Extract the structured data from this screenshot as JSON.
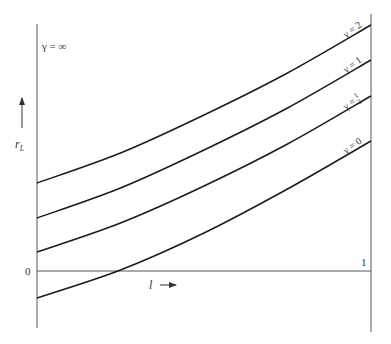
{
  "chart_data": {
    "type": "line",
    "title": "",
    "xlabel": "l",
    "ylabel": "r_L",
    "x_ticks": [
      "0",
      "1"
    ],
    "y_ticks": [
      "0"
    ],
    "xlim": [
      0,
      1
    ],
    "ylim": [
      -0.57,
      2.57
    ],
    "grid": false,
    "legend_position": "inline, at right end of each curve",
    "annotations": [
      "γ = ∞ (near top-left, along the left axis)"
    ],
    "x": [
      0,
      0.25,
      0.5,
      0.75,
      1.0
    ],
    "series": [
      {
        "name": "γ = 2",
        "label": "γ = 2",
        "values": [
          0.88,
          1.18,
          1.56,
          1.98,
          2.46
        ]
      },
      {
        "name": "γ = 1",
        "label": "γ = 1",
        "values": [
          0.53,
          0.83,
          1.21,
          1.63,
          2.11
        ]
      },
      {
        "name": "γ = 1/2",
        "label": "γ = ½",
        "values": [
          0.19,
          0.48,
          0.85,
          1.27,
          1.75
        ]
      },
      {
        "name": "γ = 0",
        "label": "γ = 0",
        "values": [
          -0.27,
          0.01,
          0.38,
          0.82,
          1.3
        ]
      }
    ],
    "curve_color": "#1a1a1a",
    "axis_color": "#555555"
  },
  "labels": {
    "gamma_inf": "γ = ∞",
    "ylabel_main": "r",
    "ylabel_sub": "L",
    "xlabel": "l",
    "origin": "0",
    "x_end": "1",
    "gamma_2": "γ = 2",
    "gamma_1": "γ = 1",
    "gamma_half_prefix": "γ =",
    "gamma_half_num": "1",
    "gamma_half_den": "2",
    "gamma_0": "γ = 0"
  }
}
